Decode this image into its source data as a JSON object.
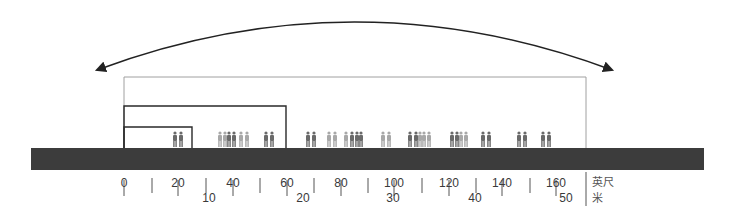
{
  "diagram": {
    "colors": {
      "ground": "#3c3c3c",
      "arc": "#222222",
      "outer_frame": "#a0a0a0",
      "building_line": "#2a2a2a",
      "figure_dark": "#6a6a6a",
      "figure_light": "#a8a8a8",
      "tick": "#555555"
    },
    "arc": {
      "label": "span-arrow",
      "from_x": 97,
      "to_x": 612,
      "y": 70,
      "peak_y": 21
    },
    "frames": [
      {
        "name": "outer-envelope",
        "x1": 124,
        "x2": 586,
        "top": 77
      },
      {
        "name": "middle-volume",
        "x1": 124,
        "x2": 286,
        "top": 106
      },
      {
        "name": "inner-volume",
        "x1": 124,
        "x2": 192,
        "top": 127
      }
    ],
    "ground": {
      "x1": 31,
      "x2": 704,
      "top": 148,
      "bottom": 170
    },
    "figures_x": [
      175,
      181,
      220,
      225,
      229,
      234,
      241,
      247,
      266,
      272,
      308,
      314,
      329,
      335,
      346,
      352,
      357,
      361,
      383,
      389,
      410,
      416,
      420,
      424,
      429,
      452,
      457,
      461,
      466,
      483,
      489,
      519,
      525,
      543,
      549
    ],
    "figures_shade": [
      "d",
      "d",
      "l",
      "l",
      "d",
      "d",
      "l",
      "l",
      "d",
      "d",
      "d",
      "d",
      "l",
      "l",
      "l",
      "d",
      "d",
      "d",
      "l",
      "l",
      "d",
      "d",
      "l",
      "l",
      "l",
      "d",
      "d",
      "l",
      "l",
      "d",
      "d",
      "d",
      "d",
      "d",
      "d"
    ],
    "scale_feet": {
      "unit": "英尺",
      "ticks": [
        {
          "label": "0",
          "x": 124
        },
        {
          "label": "20",
          "x": 178
        },
        {
          "label": "40",
          "x": 233
        },
        {
          "label": "60",
          "x": 287
        },
        {
          "label": "80",
          "x": 341
        },
        {
          "label": "100",
          "x": 394
        },
        {
          "label": "120",
          "x": 449
        },
        {
          "label": "140",
          "x": 502
        },
        {
          "label": "160",
          "x": 556
        }
      ]
    },
    "scale_meters": {
      "unit": "米",
      "ticks": [
        {
          "label": "10",
          "x": 209
        },
        {
          "label": "20",
          "x": 303
        },
        {
          "label": "30",
          "x": 393
        },
        {
          "label": "40",
          "x": 475
        },
        {
          "label": "50",
          "x": 566
        }
      ]
    },
    "minor_ticks_x": [
      152,
      206,
      260,
      314,
      368,
      422,
      476,
      530
    ]
  }
}
